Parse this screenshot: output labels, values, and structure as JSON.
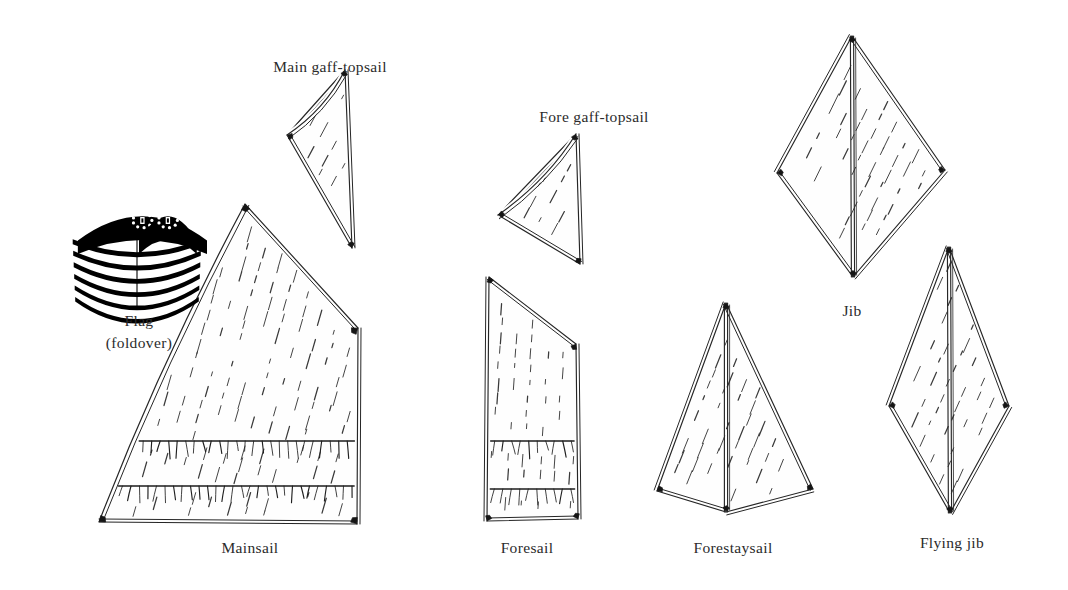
{
  "figure": {
    "background_color": "#ffffff",
    "ink_color": "#1a1a1a",
    "line_color": "#262626",
    "stitch_color": "#3a3a3a",
    "flag_color": "#000000",
    "width": 1068,
    "height": 590
  },
  "labels": {
    "main_gaff_topsail": "Main gaff-topsail",
    "fore_gaff_topsail": "Fore gaff-topsail",
    "flag_line1": "Flag",
    "flag_line2": "(foldover)",
    "mainsail": "Mainsail",
    "foresail": "Foresail",
    "forestaysail": "Forestaysail",
    "jib": "Jib",
    "flying_jib": "Flying jib"
  },
  "sails": [
    {
      "name": "main-gaff-topsail",
      "label": "Main gaff-topsail",
      "label_x": 330,
      "label_y": 58,
      "shape": "triangle-concave-luff",
      "points": [
        [
          287,
          135
        ],
        [
          345,
          70
        ],
        [
          352,
          248
        ]
      ],
      "folded": false,
      "reef_bands": 0,
      "stitch_angle_deg": -28,
      "corner_patches": 3
    },
    {
      "name": "mainsail",
      "label": "Mainsail",
      "label_x": 250,
      "label_y": 539,
      "shape": "quadrilateral-gaff",
      "points": [
        [
          245,
          204
        ],
        [
          358,
          328
        ],
        [
          357,
          524
        ],
        [
          99,
          522
        ]
      ],
      "curved_luff": true,
      "folded": false,
      "reef_bands": 2,
      "reef_band_y": [
        441,
        486
      ],
      "stitch_angle_deg": -16,
      "corner_patches": 4
    },
    {
      "name": "fore-gaff-topsail",
      "label": "Fore gaff-topsail",
      "label_x": 594,
      "label_y": 108,
      "shape": "triangle-concave-luff",
      "points": [
        [
          498,
          215
        ],
        [
          576,
          134
        ],
        [
          580,
          264
        ]
      ],
      "folded": false,
      "reef_bands": 0,
      "stitch_angle_deg": -28,
      "corner_patches": 3
    },
    {
      "name": "foresail",
      "label": "Foresail",
      "label_x": 527,
      "label_y": 539,
      "shape": "quadrilateral-gaff",
      "points": [
        [
          489,
          277
        ],
        [
          576,
          344
        ],
        [
          578,
          519
        ],
        [
          487,
          521
        ]
      ],
      "folded": false,
      "reef_bands": 2,
      "reef_band_y": [
        441,
        489
      ],
      "stitch_angle_deg": -4,
      "corner_patches": 4
    },
    {
      "name": "forestaysail",
      "label": "Forestaysail",
      "label_x": 733,
      "label_y": 539,
      "shape": "kite-folded",
      "points": [
        [
          726,
          303
        ],
        [
          813,
          489
        ],
        [
          726,
          512
        ],
        [
          657,
          491
        ]
      ],
      "folded": true,
      "fold_axis": "vertical",
      "reef_bands": 0,
      "stitch_angle_deg": -22,
      "corner_patches": 4
    },
    {
      "name": "jib",
      "label": "Jib",
      "label_x": 852,
      "label_y": 302,
      "shape": "diamond-folded",
      "points": [
        [
          852,
          36
        ],
        [
          945,
          170
        ],
        [
          853,
          277
        ],
        [
          777,
          173
        ]
      ],
      "folded": true,
      "fold_axis": "vertical",
      "reef_bands": 0,
      "stitch_angle_deg": -26,
      "corner_patches": 4
    },
    {
      "name": "flying-jib",
      "label": "Flying jib",
      "label_x": 952,
      "label_y": 534,
      "shape": "diamond-folded",
      "points": [
        [
          949,
          247
        ],
        [
          1009,
          406
        ],
        [
          950,
          513
        ],
        [
          889,
          406
        ]
      ],
      "folded": true,
      "fold_axis": "vertical",
      "reef_bands": 0,
      "stitch_angle_deg": -24,
      "corner_patches": 4
    }
  ],
  "flag": {
    "name": "flag-foldover",
    "label_line1": "Flag",
    "label_line2": "(foldover)",
    "label_x": 139,
    "label_y": 310,
    "type": "us-flag-folded-over",
    "stripes": 6,
    "cantons": 2,
    "stars_per_canton": 9,
    "bounds": [
      72,
      198,
      130,
      112
    ]
  }
}
